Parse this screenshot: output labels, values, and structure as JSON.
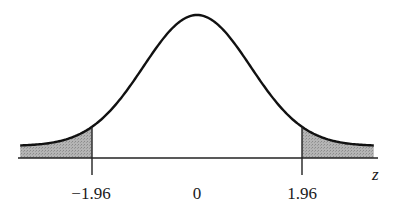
{
  "chart_data": {
    "type": "area",
    "title": "",
    "xlabel": "z",
    "ylabel": "",
    "xlim": [
      -3.3,
      3.3
    ],
    "tick_labels": [
      "−1.96",
      "0",
      "1.96"
    ],
    "tick_values": [
      -1.96,
      0,
      1.96
    ],
    "shaded_regions": [
      {
        "from": -3.3,
        "to": -1.96,
        "label": "lower tail"
      },
      {
        "from": 1.96,
        "to": 3.3,
        "label": "upper tail"
      }
    ],
    "critical_values": [
      -1.96,
      1.96
    ],
    "grid": false,
    "legend": null,
    "colors": {
      "curve": "#111111",
      "shade": "#a8a8a8",
      "axis": "#222222"
    }
  }
}
